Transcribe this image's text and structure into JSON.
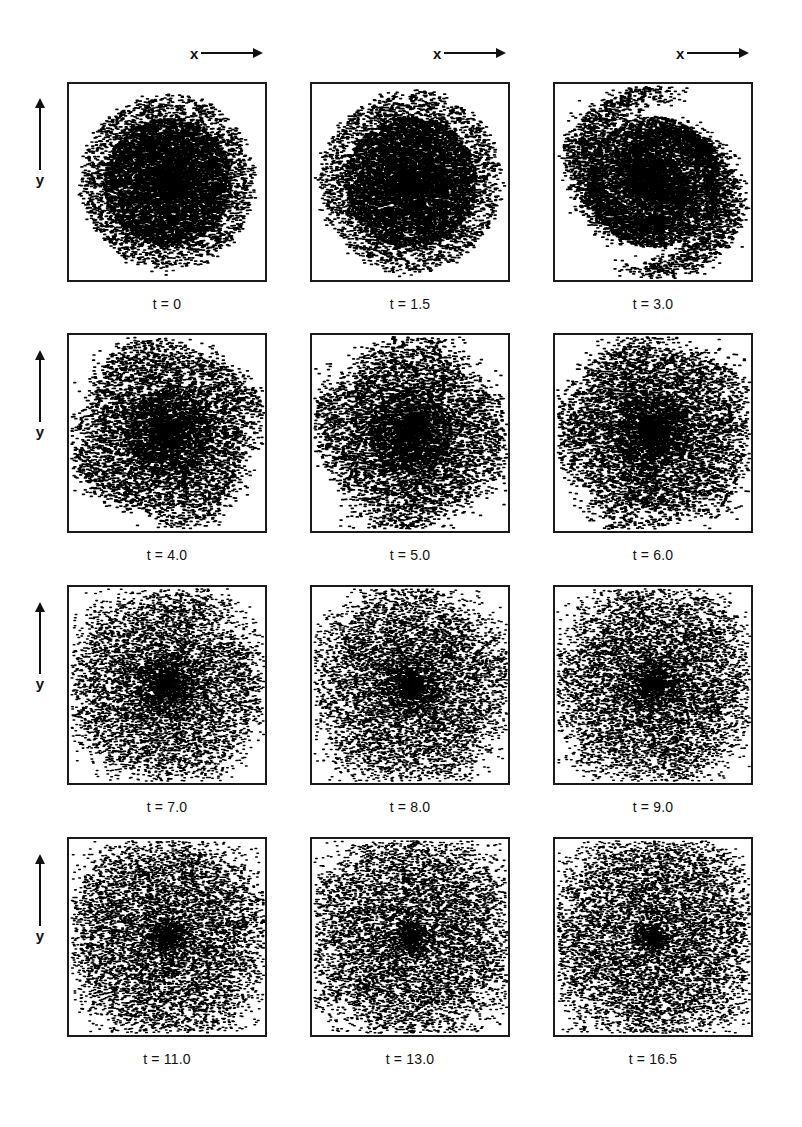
{
  "figure": {
    "axis": {
      "x_letter": "x",
      "y_letter": "y",
      "x_arrow_icon": "right-arrow-icon",
      "y_arrow_icon": "up-arrow-icon"
    },
    "columns": 3,
    "rows": 4,
    "panels": [
      {
        "caption": "t = 0",
        "time": 0.0,
        "row": 1,
        "col": 1,
        "morphology": "axisymmetric dense disc, smooth circular core with fuzzy halo",
        "core_radius_frac": 0.3,
        "halo_radius_frac": 0.44,
        "arms": 0,
        "clumpiness": 0.05
      },
      {
        "caption": "t = 1.5",
        "time": 1.5,
        "row": 1,
        "col": 2,
        "morphology": "axisymmetric dense disc, slightly larger and grainier",
        "core_radius_frac": 0.31,
        "halo_radius_frac": 0.46,
        "arms": 0,
        "clumpiness": 0.1
      },
      {
        "caption": "t = 3.0",
        "time": 3.0,
        "row": 1,
        "col": 3,
        "morphology": "disc beginning to show weak non-axisymmetric edge structure",
        "core_radius_frac": 0.31,
        "halo_radius_frac": 0.48,
        "arms": 2,
        "clumpiness": 0.22
      },
      {
        "caption": "t = 4.0",
        "time": 4.0,
        "row": 2,
        "col": 1,
        "morphology": "multi-armed spiral pattern emerging around dense core",
        "core_radius_frac": 0.22,
        "halo_radius_frac": 0.47,
        "arms": 4,
        "clumpiness": 0.38
      },
      {
        "caption": "t = 5.0",
        "time": 5.0,
        "row": 2,
        "col": 2,
        "morphology": "open multi-armed spiral, core still dominant",
        "core_radius_frac": 0.21,
        "halo_radius_frac": 0.47,
        "arms": 4,
        "clumpiness": 0.45
      },
      {
        "caption": "t = 6.0",
        "time": 6.0,
        "row": 2,
        "col": 3,
        "morphology": "multi-armed spiral with pronounced inter-arm gaps",
        "core_radius_frac": 0.19,
        "halo_radius_frac": 0.48,
        "arms": 5,
        "clumpiness": 0.52
      },
      {
        "caption": "t = 7.0",
        "time": 7.0,
        "row": 3,
        "col": 1,
        "morphology": "well developed flocculent spiral, core weakening",
        "core_radius_frac": 0.16,
        "halo_radius_frac": 0.49,
        "arms": 5,
        "clumpiness": 0.62
      },
      {
        "caption": "t = 8.0",
        "time": 8.0,
        "row": 3,
        "col": 2,
        "morphology": "flocculent multi-arm spiral, arms broadening",
        "core_radius_frac": 0.15,
        "halo_radius_frac": 0.49,
        "arms": 5,
        "clumpiness": 0.68
      },
      {
        "caption": "t = 9.0",
        "time": 9.0,
        "row": 3,
        "col": 3,
        "morphology": "ragged spiral arms, increasing inter-arm voids",
        "core_radius_frac": 0.14,
        "halo_radius_frac": 0.5,
        "arms": 6,
        "clumpiness": 0.74
      },
      {
        "caption": "t = 11.0",
        "time": 11.0,
        "row": 4,
        "col": 1,
        "morphology": "highly fragmented flocculent arms, no central concentration",
        "core_radius_frac": 0.1,
        "halo_radius_frac": 0.5,
        "arms": 6,
        "clumpiness": 0.85
      },
      {
        "caption": "t = 13.0",
        "time": 13.0,
        "row": 4,
        "col": 2,
        "morphology": "chaotic filamentary structure filling the frame",
        "core_radius_frac": 0.09,
        "halo_radius_frac": 0.51,
        "arms": 6,
        "clumpiness": 0.9
      },
      {
        "caption": "t = 16.5",
        "time": 16.5,
        "row": 4,
        "col": 3,
        "morphology": "fully disrupted flocculent disc, broad scattered filaments",
        "core_radius_frac": 0.08,
        "halo_radius_frac": 0.52,
        "arms": 7,
        "clumpiness": 0.95
      }
    ]
  },
  "chart_data": {
    "type": "scatter",
    "title": "",
    "xlabel": "x",
    "ylabel": "y",
    "grid": false,
    "legend": null,
    "panel_layout": {
      "rows": 4,
      "cols": 3
    },
    "series_label": "N-body particles",
    "time_values": [
      0,
      1.5,
      3.0,
      4.0,
      5.0,
      6.0,
      7.0,
      8.0,
      9.0,
      11.0,
      13.0,
      16.5
    ],
    "time_labels": [
      "t = 0",
      "t = 1.5",
      "t = 3.0",
      "t = 4.0",
      "t = 5.0",
      "t = 6.0",
      "t = 7.0",
      "t = 8.0",
      "t = 9.0",
      "t = 11.0",
      "t = 13.0",
      "t = 16.5"
    ]
  },
  "colors": {
    "particle": "#000000",
    "frame": "#1a1a1a",
    "background": "#ffffff"
  }
}
